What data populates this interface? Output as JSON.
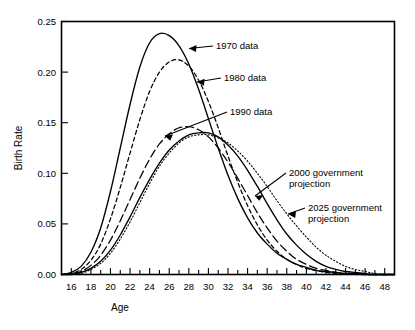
{
  "chart_data": {
    "type": "line",
    "title": "",
    "xlabel": "Age",
    "ylabel": "Birth Rate",
    "xlim": [
      15,
      49
    ],
    "ylim": [
      0.0,
      0.25
    ],
    "grid": false,
    "legend_position": "inline-annotations",
    "x_ticks_major": [
      16,
      18,
      20,
      22,
      24,
      26,
      28,
      30,
      32,
      34,
      36,
      38,
      40,
      42,
      44,
      46,
      48
    ],
    "x_tick_labels": [
      "16",
      "18",
      "20",
      "22",
      "24",
      "26",
      "28",
      "30",
      "32",
      "34",
      "36",
      "38",
      "40",
      "42",
      "44",
      "46",
      "48"
    ],
    "x_ticks_minor_step": 1,
    "y_ticks": [
      0.0,
      0.05,
      0.1,
      0.15,
      0.2,
      0.25
    ],
    "y_tick_labels": [
      "0.00",
      "0.05",
      "0.10",
      "0.15",
      "0.20",
      "0.25"
    ],
    "x": [
      15,
      16,
      17,
      18,
      19,
      20,
      21,
      22,
      23,
      24,
      25,
      26,
      27,
      28,
      29,
      30,
      31,
      32,
      33,
      34,
      35,
      36,
      37,
      38,
      39,
      40,
      41,
      42,
      43,
      44,
      45,
      46,
      47,
      48,
      49
    ],
    "series": [
      {
        "name": "1970 data",
        "label": "1970 data",
        "style": "solid",
        "peak_age": 25,
        "peak_value": 0.238,
        "values": [
          0.0,
          0.002,
          0.008,
          0.022,
          0.046,
          0.082,
          0.125,
          0.168,
          0.205,
          0.229,
          0.238,
          0.236,
          0.226,
          0.208,
          0.183,
          0.154,
          0.125,
          0.098,
          0.075,
          0.056,
          0.041,
          0.03,
          0.021,
          0.015,
          0.01,
          0.007,
          0.004,
          0.003,
          0.002,
          0.001,
          0.001,
          0.0,
          0.0,
          0.0,
          0.0
        ]
      },
      {
        "name": "1980 data",
        "label": "1980 data",
        "style": "short-dash",
        "peak_age": 26.5,
        "peak_value": 0.212,
        "values": [
          0.0,
          0.001,
          0.005,
          0.014,
          0.03,
          0.055,
          0.086,
          0.12,
          0.153,
          0.181,
          0.2,
          0.21,
          0.212,
          0.206,
          0.192,
          0.171,
          0.145,
          0.117,
          0.091,
          0.068,
          0.049,
          0.034,
          0.023,
          0.015,
          0.01,
          0.006,
          0.004,
          0.002,
          0.001,
          0.001,
          0.0,
          0.0,
          0.0,
          0.0,
          0.0
        ]
      },
      {
        "name": "1990 data",
        "label": "1990 data",
        "style": "long-dash",
        "peak_age": 28.5,
        "peak_value": 0.146,
        "values": [
          0.0,
          0.001,
          0.003,
          0.009,
          0.019,
          0.034,
          0.053,
          0.074,
          0.095,
          0.114,
          0.129,
          0.139,
          0.145,
          0.146,
          0.143,
          0.136,
          0.125,
          0.111,
          0.095,
          0.078,
          0.061,
          0.046,
          0.033,
          0.023,
          0.015,
          0.01,
          0.006,
          0.004,
          0.002,
          0.001,
          0.001,
          0.0,
          0.0,
          0.0,
          0.0
        ]
      },
      {
        "name": "2000 government projection",
        "label": "2000 government projection",
        "style": "solid",
        "peak_age": 30,
        "peak_value": 0.14,
        "values": [
          0.0,
          0.0,
          0.002,
          0.006,
          0.013,
          0.024,
          0.039,
          0.057,
          0.076,
          0.094,
          0.11,
          0.123,
          0.132,
          0.138,
          0.14,
          0.14,
          0.136,
          0.128,
          0.117,
          0.103,
          0.087,
          0.07,
          0.054,
          0.04,
          0.029,
          0.02,
          0.013,
          0.008,
          0.005,
          0.003,
          0.002,
          0.001,
          0.0,
          0.0,
          0.0
        ]
      },
      {
        "name": "2025 government projection",
        "label": "2025 government projection",
        "style": "dotted",
        "peak_age": 30.5,
        "peak_value": 0.138,
        "values": [
          0.0,
          0.0,
          0.001,
          0.005,
          0.011,
          0.021,
          0.035,
          0.052,
          0.071,
          0.09,
          0.107,
          0.12,
          0.13,
          0.136,
          0.138,
          0.138,
          0.135,
          0.13,
          0.122,
          0.112,
          0.1,
          0.087,
          0.073,
          0.06,
          0.048,
          0.037,
          0.027,
          0.019,
          0.013,
          0.008,
          0.005,
          0.003,
          0.001,
          0.0,
          0.0
        ]
      }
    ],
    "annotations": [
      {
        "text": "1970 data",
        "target_series": "1970 data"
      },
      {
        "text": "1980 data",
        "target_series": "1980 data"
      },
      {
        "text": "1990 data",
        "target_series": "1990 data"
      },
      {
        "text_line1": "2000 government",
        "text_line2": "projection",
        "target_series": "2000 government projection"
      },
      {
        "text_line1": "2025 government",
        "text_line2": "projection",
        "target_series": "2025 government projection"
      }
    ]
  },
  "labels": {
    "y_axis_title": "Birth Rate",
    "x_axis_title": "Age",
    "annot_1970": "1970 data",
    "annot_1980": "1980 data",
    "annot_1990": "1990 data",
    "annot_2000_l1": "2000 government",
    "annot_2000_l2": "projection",
    "annot_2025_l1": "2025 government",
    "annot_2025_l2": "projection",
    "y0": "0.00",
    "y1": "0.05",
    "y2": "0.10",
    "y3": "0.15",
    "y4": "0.20",
    "y5": "0.25",
    "x16": "16",
    "x18": "18",
    "x20": "20",
    "x22": "22",
    "x24": "24",
    "x26": "26",
    "x28": "28",
    "x30": "30",
    "x32": "32",
    "x34": "34",
    "x36": "36",
    "x38": "38",
    "x40": "40",
    "x42": "42",
    "x44": "44",
    "x46": "46",
    "x48": "48"
  },
  "colors": {
    "ink": "#000000",
    "background": "#ffffff"
  }
}
